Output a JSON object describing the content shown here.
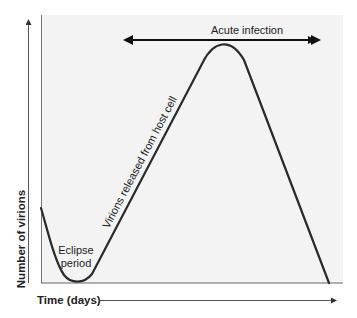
{
  "diagram": {
    "panel_color": "#f3f3f3",
    "line_color": "#2a2a2a",
    "axis_color": "#555555",
    "y_axis": {
      "label": "Number of virions"
    },
    "x_axis": {
      "label": "Time (days)"
    },
    "annotations": {
      "acute_infection": "Acute infection",
      "eclipse_line1": "Eclipse",
      "eclipse_line2": "period",
      "virions_released": "Virions released from host cell"
    },
    "phases": [
      {
        "name": "Eclipse period",
        "description": "virion count drops to minimum"
      },
      {
        "name": "Virions released from host cell",
        "description": "linear rise to peak"
      },
      {
        "name": "Acute infection",
        "description": "peak and subsequent decline"
      }
    ]
  }
}
